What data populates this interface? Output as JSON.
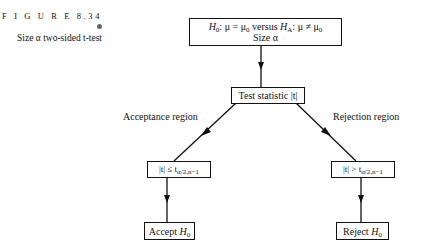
{
  "figure": {
    "number_label": "F I G U R E 8.34",
    "caption": "Size α two-sided t-test"
  },
  "nodes": {
    "hypotheses": {
      "h0_var": "H",
      "h0_sub": "0",
      "h0_rest": ": μ = μ",
      "h0_rest_sub": "0",
      "versus": " versus ",
      "ha_var": "H",
      "ha_sub": "A",
      "ha_rest": ": μ ≠ μ",
      "ha_rest_sub": "0",
      "line2": "Size α"
    },
    "test_statistic": {
      "text": "Test statistic |t|"
    },
    "accept_condition": {
      "lhs": "|t| ≤ t",
      "sub": "α/2,n−1"
    },
    "reject_condition": {
      "lhs": "|t| > t",
      "sub": "α/2,n−1"
    },
    "accept": {
      "text": "Accept ",
      "var": "H",
      "sub": "0"
    },
    "reject": {
      "text": "Reject ",
      "var": "H",
      "sub": "0"
    }
  },
  "edge_labels": {
    "left": "Acceptance region",
    "right": "Rejection region"
  },
  "colors": {
    "line": "#111111",
    "background": "#ffffff"
  }
}
